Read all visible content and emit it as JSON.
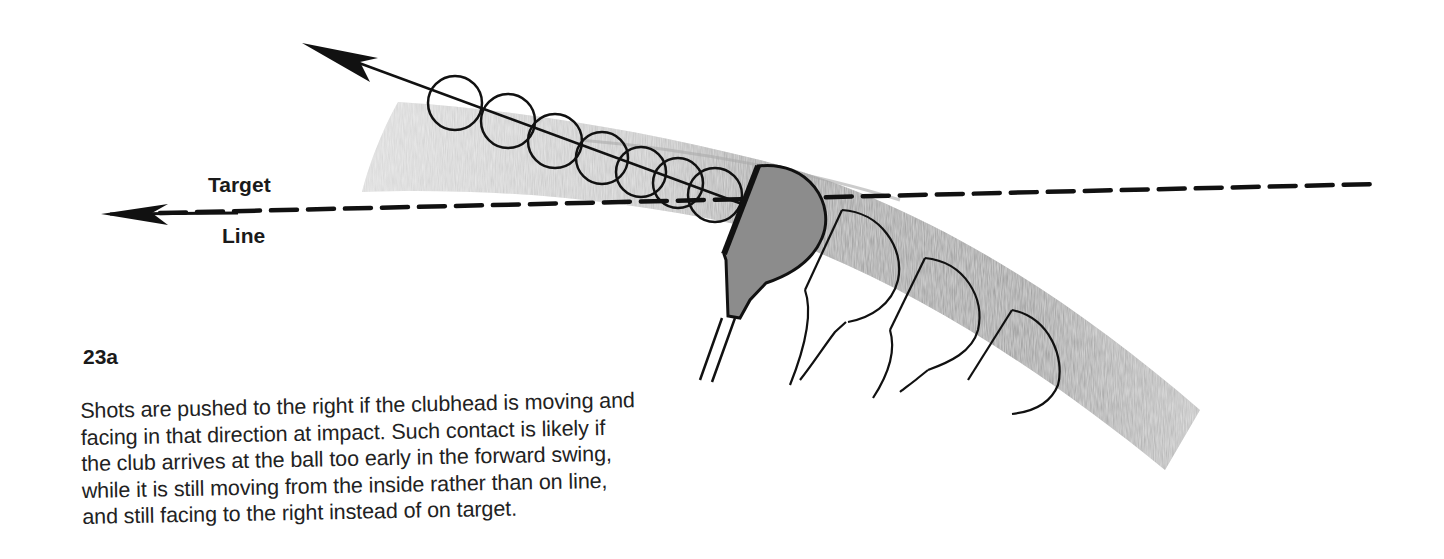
{
  "figure": {
    "number": "23a",
    "labels": {
      "target": "Target",
      "line": "Line"
    },
    "elements": {
      "swing_path_arrow": "arrow pointing up-left along ball flight path",
      "target_line": "dashed horizontal target line with arrowhead pointing left",
      "balls_count": 7,
      "clubheads_count": 4,
      "swing_arc": "gray shaded curved band of clubhead path"
    },
    "colors": {
      "ink": "#111111",
      "arc_shade": "#9a9a9a",
      "arc_light": "#c8c8c8",
      "clubhead_fill": "#8f8f8f",
      "background": "#ffffff"
    }
  },
  "caption": {
    "lines": [
      "Shots are pushed to the right if the clubhead is moving and",
      "facing in that direction at impact. Such contact is likely if",
      "the club arrives at the ball too early in the forward swing,",
      "while it is still moving from the inside rather than on line,",
      "and still facing to the right instead of on target."
    ]
  }
}
